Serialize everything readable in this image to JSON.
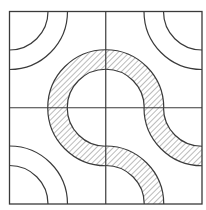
{
  "diagram": {
    "title": "",
    "type": "truchet-tile-grid",
    "grid": {
      "rows": 2,
      "cols": 2
    },
    "frame": {
      "x": 9.5,
      "y": 11.5,
      "size": 192.5
    },
    "radii": {
      "inner": 38.5,
      "outer": 58
    },
    "colors": {
      "stroke": "#3a3a3a",
      "hatch": "#777777",
      "background": "#ffffff"
    },
    "tiles": [
      {
        "id": "top-left",
        "plain_corner": "top-left",
        "hatched_corner": "bottom-right"
      },
      {
        "id": "top-right",
        "plain_corner": "top-right",
        "hatched_corner": "bottom-left"
      },
      {
        "id": "bottom-left",
        "plain_corner": "bottom-left",
        "hatched_corner": "top-right"
      },
      {
        "id": "bottom-right",
        "plain_corner": null,
        "hatched_corners": [
          "top-right",
          "bottom-left"
        ]
      }
    ]
  }
}
